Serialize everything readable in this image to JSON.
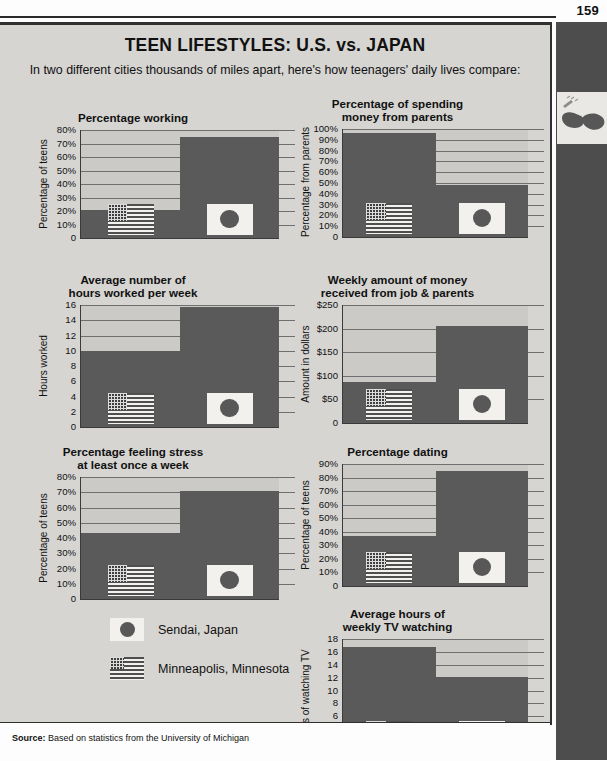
{
  "page": {
    "number": "159",
    "title": "TEEN LIFESTYLES: U.S. vs. JAPAN",
    "subtitle": "In two different cities thousands of miles apart, here's how teenagers' daily lives compare:",
    "source_label": "Source:",
    "source_text": "Based on statistics from the University of Michigan",
    "sidebar_thumb_icon": "sunglasses-icon"
  },
  "legend": {
    "items": [
      {
        "icon": "japan-flag-icon",
        "label": "Sendai, Japan"
      },
      {
        "icon": "us-flag-icon",
        "label": "Minneapolis, Minnesota"
      }
    ]
  },
  "colors": {
    "bar": "#5a5a5a",
    "plot_background": "#cbcac6",
    "panel_background": "#d6d5d1",
    "sidebar": "#4d4d4d",
    "gridline": "#6f6f6f",
    "axis": "#3a3a3a"
  },
  "chart_data": [
    {
      "type": "bar",
      "title": "Percentage working",
      "ylabel": "Percentage of teens",
      "xlabel": "",
      "categories": [
        "Minneapolis, Minnesota",
        "Sendai, Japan"
      ],
      "values": [
        21,
        75
      ],
      "ylim": [
        0,
        80
      ],
      "yticks": [
        0,
        10,
        20,
        30,
        40,
        50,
        60,
        70,
        80
      ],
      "yticklabels": [
        "0",
        "10%",
        "20%",
        "30%",
        "40%",
        "50%",
        "60%",
        "70%",
        "80%"
      ],
      "grid": true,
      "legend": "external"
    },
    {
      "type": "bar",
      "title": "Percentage of spending\nmoney from parents",
      "title_lines": [
        "Percentage of spending",
        "money from parents"
      ],
      "ylabel": "Percentage from parents",
      "xlabel": "",
      "categories": [
        "Minneapolis, Minnesota",
        "Sendai, Japan"
      ],
      "values": [
        96,
        48
      ],
      "ylim": [
        0,
        100
      ],
      "yticks": [
        0,
        10,
        20,
        30,
        40,
        50,
        60,
        70,
        80,
        90,
        100
      ],
      "yticklabels": [
        "0",
        "10%",
        "20%",
        "30%",
        "40%",
        "50%",
        "60%",
        "70%",
        "80%",
        "90%",
        "100%"
      ],
      "grid": true,
      "legend": "external"
    },
    {
      "type": "bar",
      "title": "Average number of\nhours worked per week",
      "title_lines": [
        "Average number of",
        "hours worked per week"
      ],
      "ylabel": "Hours worked",
      "xlabel": "",
      "categories": [
        "Minneapolis, Minnesota",
        "Sendai, Japan"
      ],
      "values": [
        10,
        15.7
      ],
      "ylim": [
        0,
        16
      ],
      "yticks": [
        0,
        2,
        4,
        6,
        8,
        10,
        12,
        14,
        16
      ],
      "yticklabels": [
        "0",
        "2",
        "4",
        "6",
        "8",
        "10",
        "12",
        "14",
        "16"
      ],
      "grid": true,
      "legend": "external"
    },
    {
      "type": "bar",
      "title": "Weekly amount of money\nreceived from job & parents",
      "title_lines": [
        "Weekly amount of money",
        "received from job & parents"
      ],
      "ylabel": "Amount in dollars",
      "xlabel": "",
      "categories": [
        "Minneapolis, Minnesota",
        "Sendai, Japan"
      ],
      "values": [
        87,
        205
      ],
      "ylim": [
        0,
        250
      ],
      "yticks": [
        0,
        50,
        100,
        150,
        200,
        250
      ],
      "yticklabels": [
        "0",
        "$50",
        "$100",
        "$150",
        "$200",
        "$250"
      ],
      "grid": true,
      "legend": "external"
    },
    {
      "type": "bar",
      "title": "Percentage feeling stress\nat least once a week",
      "title_lines": [
        "Percentage feeling stress",
        "at least once a week"
      ],
      "ylabel": "Percentage of teens",
      "xlabel": "",
      "categories": [
        "Minneapolis, Minnesota",
        "Sendai, Japan"
      ],
      "values": [
        43,
        71
      ],
      "ylim": [
        0,
        80
      ],
      "yticks": [
        0,
        10,
        20,
        30,
        40,
        50,
        60,
        70,
        80
      ],
      "yticklabels": [
        "0",
        "10%",
        "20%",
        "30%",
        "40%",
        "50%",
        "60%",
        "70%",
        "80%"
      ],
      "grid": true,
      "legend": "external"
    },
    {
      "type": "bar",
      "title": "Percentage dating",
      "ylabel": "Percentage of teens",
      "xlabel": "",
      "categories": [
        "Minneapolis, Minnesota",
        "Sendai, Japan"
      ],
      "values": [
        37,
        85
      ],
      "ylim": [
        0,
        90
      ],
      "yticks": [
        0,
        10,
        20,
        30,
        40,
        50,
        60,
        70,
        80,
        90
      ],
      "yticklabels": [
        "0",
        "10%",
        "20%",
        "30%",
        "40%",
        "50%",
        "60%",
        "70%",
        "80%",
        "90%"
      ],
      "grid": true,
      "legend": "external"
    },
    {
      "type": "bar",
      "title": "Average hours of\nweekly TV watching",
      "title_lines": [
        "Average hours of",
        "weekly TV watching"
      ],
      "ylabel": "Hours of watching TV",
      "xlabel": "",
      "categories": [
        "Minneapolis, Minnesota",
        "Sendai, Japan"
      ],
      "values": [
        16.8,
        12.1
      ],
      "ylim": [
        0,
        18
      ],
      "yticks": [
        0,
        2,
        4,
        6,
        8,
        10,
        12,
        14,
        16,
        18
      ],
      "yticklabels": [
        "0",
        "2",
        "4",
        "6",
        "8",
        "10",
        "12",
        "14",
        "16",
        "18"
      ],
      "grid": true,
      "legend": "external"
    }
  ]
}
